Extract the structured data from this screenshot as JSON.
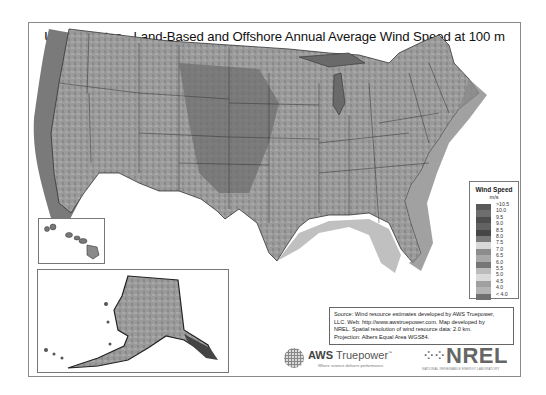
{
  "title": "United States - Land-Based and Offshore Annual Average Wind Speed at 100 m",
  "legend": {
    "title": "Wind Speed",
    "unit": "m/s",
    "entries": [
      {
        "label": ">10.5",
        "color": "#5a5a5a"
      },
      {
        "label": "10.0",
        "color": "#6e6e6e"
      },
      {
        "label": "9.5",
        "color": "#4e4e4e"
      },
      {
        "label": "9.0",
        "color": "#626262"
      },
      {
        "label": "8.5",
        "color": "#464646"
      },
      {
        "label": "8.0",
        "color": "#7a7a7a"
      },
      {
        "label": "7.5",
        "color": "#d8d8d8"
      },
      {
        "label": "7.0",
        "color": "#8c8c8c"
      },
      {
        "label": "6.5",
        "color": "#a8a8a8"
      },
      {
        "label": "6.0",
        "color": "#767676"
      },
      {
        "label": "5.5",
        "color": "#bcbcbc"
      },
      {
        "label": "5.0",
        "color": "#dadada"
      },
      {
        "label": "4.5",
        "color": "#a0a0a0"
      },
      {
        "label": "4.0",
        "color": "#b4b4b4"
      },
      {
        "label": "< 4.0",
        "color": "#707070"
      }
    ]
  },
  "insets": {
    "hawaii": "Hawaii",
    "alaska": "Alaska"
  },
  "source": {
    "line1": "Source: Wind resource estimates developed by AWS Truepower,",
    "line2": "LLC.  Web: http://www.awstruepower.com. Map developed by",
    "line3": "NREL.  Spatial resolution of wind resource data: 2.0 km.",
    "line4": "Projection: Albers Equal Area WGS84."
  },
  "logos": {
    "aws_prefix": "AWS",
    "aws_name": "Truepower",
    "aws_tm": "™",
    "aws_tagline": "Where science delivers performance.",
    "nrel_mark": "⁘⁘",
    "nrel_name": "NREL",
    "nrel_subtitle": "NATIONAL RENEWABLE ENERGY LABORATORY"
  }
}
